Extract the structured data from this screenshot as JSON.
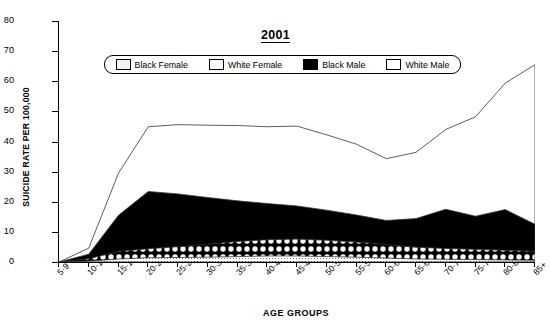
{
  "title": "2001",
  "axis": {
    "y_label": "SUICIDE RATE PER 100,000",
    "x_label": "AGE GROUPS",
    "y_ticks": [
      "0",
      "10",
      "20",
      "30",
      "40",
      "50",
      "60",
      "70",
      "80"
    ]
  },
  "legend": {
    "items": [
      {
        "label": "Black Female",
        "pattern": "fine-dots",
        "color": "#f2f2f2"
      },
      {
        "label": "White Female",
        "pattern": "checker",
        "color": "#ffffff"
      },
      {
        "label": "Black Male",
        "pattern": "solid",
        "color": "#000000"
      },
      {
        "label": "White Male",
        "pattern": "none",
        "color": "#ffffff"
      }
    ]
  },
  "chart_data": {
    "type": "area",
    "stacked": true,
    "title": "2001",
    "xlabel": "AGE GROUPS",
    "ylabel": "SUICIDE RATE PER 100,000",
    "ylim": [
      0,
      80
    ],
    "ytick_step": 10,
    "grid": false,
    "legend_position": "top-inside",
    "categories": [
      "5-9",
      "10-14",
      "15-19",
      "20-24",
      "25-29",
      "30-34",
      "35-39",
      "40-44",
      "45-49",
      "50-54",
      "55-59",
      "60-64",
      "65-69",
      "70-74",
      "75-79",
      "80-84",
      "85+"
    ],
    "series": [
      {
        "name": "Black Female",
        "pattern": "fine-dots",
        "color": "#f2f2f2",
        "values": [
          0,
          0.3,
          1.0,
          1.4,
          1.5,
          1.6,
          1.8,
          2.0,
          2.0,
          1.8,
          1.6,
          1.3,
          1.0,
          0.9,
          0.8,
          0.7,
          0.6
        ]
      },
      {
        "name": "White Female",
        "pattern": "checker",
        "color": "#ffffff",
        "values": [
          0,
          0.8,
          2.5,
          3.0,
          3.6,
          4.3,
          5.0,
          5.4,
          5.6,
          5.4,
          5.0,
          4.5,
          3.9,
          3.6,
          3.4,
          3.2,
          2.9
        ]
      },
      {
        "name": "Black Male",
        "pattern": "solid",
        "color": "#000000",
        "values": [
          0,
          1.5,
          12.0,
          19.0,
          17.5,
          15.5,
          13.5,
          12.0,
          11.0,
          10.0,
          9.0,
          8.0,
          9.5,
          13.0,
          11.0,
          13.5,
          9.0
        ]
      },
      {
        "name": "White Male",
        "pattern": "none",
        "color": "#ffffff",
        "values": [
          0,
          2.0,
          14.0,
          21.5,
          23.0,
          24.0,
          25.0,
          25.5,
          26.5,
          25.0,
          23.5,
          20.5,
          22.0,
          26.5,
          33.0,
          42.0,
          53.0
        ]
      }
    ]
  }
}
